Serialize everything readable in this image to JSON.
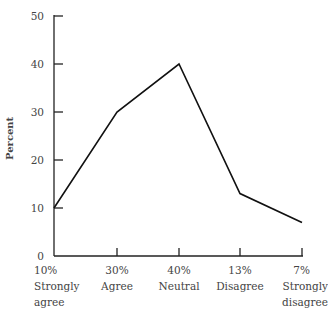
{
  "chart_data": {
    "type": "line",
    "title": "",
    "xlabel": "",
    "ylabel": "Percent",
    "ylim": [
      0,
      50
    ],
    "yticks": [
      0,
      10,
      20,
      30,
      40,
      50
    ],
    "categories": [
      "Strongly agree",
      "Agree",
      "Neutral",
      "Disagree",
      "Strongly disagree"
    ],
    "category_percent_labels": [
      "10%",
      "30%",
      "40%",
      "13%",
      "7%"
    ],
    "series": [
      {
        "name": "Percent",
        "values": [
          10,
          30,
          40,
          13,
          7
        ]
      }
    ],
    "grid": false,
    "legend": "none"
  },
  "axis": {
    "ylabel": "Percent",
    "yticks": [
      "0",
      "10",
      "20",
      "30",
      "40",
      "50"
    ]
  },
  "categories": [
    {
      "pct": "10%",
      "line1": "Strongly",
      "line2": "agree"
    },
    {
      "pct": "30%",
      "line1": "Agree",
      "line2": ""
    },
    {
      "pct": "40%",
      "line1": "Neutral",
      "line2": ""
    },
    {
      "pct": "13%",
      "line1": "Disagree",
      "line2": ""
    },
    {
      "pct": "7%",
      "line1": "Strongly",
      "line2": "disagree"
    }
  ]
}
